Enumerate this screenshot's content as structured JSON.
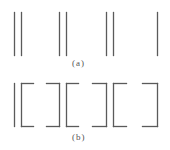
{
  "figure": {
    "stroke_color": "#5a5a5a",
    "panel_a": {
      "caption": "(a)",
      "description": "vertical line segments grouped in pairs: ||  ||  ||  |",
      "lines": [
        {
          "x": 14,
          "y1": 12,
          "y2": 55
        },
        {
          "x": 21,
          "y1": 12,
          "y2": 55
        },
        {
          "x": 59,
          "y1": 12,
          "y2": 55
        },
        {
          "x": 66,
          "y1": 12,
          "y2": 55
        },
        {
          "x": 106,
          "y1": 12,
          "y2": 55
        },
        {
          "x": 113,
          "y1": 12,
          "y2": 55
        },
        {
          "x": 157,
          "y1": 12,
          "y2": 55
        }
      ]
    },
    "panel_b": {
      "caption": "(b)",
      "description": "single line followed by three bracket pairs: | [ ] [ ] [ ]",
      "single_line": {
        "x": 14,
        "y1": 83,
        "y2": 126
      },
      "brackets": [
        {
          "type": "open",
          "x": 21,
          "arm_end": 33,
          "y1": 83,
          "y2": 126
        },
        {
          "type": "close",
          "x": 59,
          "arm_start": 46,
          "y1": 83,
          "y2": 126
        },
        {
          "type": "open",
          "x": 66,
          "arm_end": 78,
          "y1": 83,
          "y2": 126
        },
        {
          "type": "close",
          "x": 106,
          "arm_start": 92,
          "y1": 83,
          "y2": 126
        },
        {
          "type": "open",
          "x": 113,
          "arm_end": 126,
          "y1": 83,
          "y2": 126
        },
        {
          "type": "close",
          "x": 157,
          "arm_start": 142,
          "y1": 83,
          "y2": 126
        }
      ]
    }
  }
}
